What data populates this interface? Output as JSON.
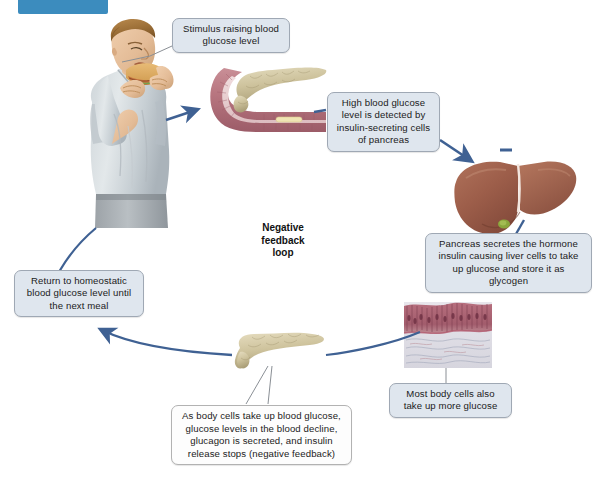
{
  "figure": {
    "title": "Negative feedback loop",
    "center_label_lines": [
      "Negative",
      "feedback",
      "loop"
    ],
    "header_chip_color": "#3c8cbe",
    "arrow_color": "#3f6193",
    "callout_fill": "#dfe6ee",
    "callout_border": "#9fa8b4"
  },
  "callouts": {
    "stimulus": "Stimulus raising blood glucose level",
    "detect": "High blood glucose level is detected by insulin-secreting cells of pancreas",
    "insulin": "Pancreas secretes the hormone insulin causing liver cells to take up glucose and store it as glycogen",
    "body_cells": "Most body cells also take up more glucose",
    "homeostasis": "Return to homeostatic blood glucose level until the next meal",
    "feedback": "As body cells take up blood glucose, glucose levels in the blood decline, glucagon is secreted, and insulin release stops (negative feedback)"
  },
  "illustrations": {
    "man": "man-eating-sandwich-illustration",
    "duodenum": "pancreas-and-duodenum-illustration",
    "liver": "liver-illustration",
    "tissue": "body-cells-tissue-micrograph",
    "pancreas": "pancreas-illustration"
  }
}
